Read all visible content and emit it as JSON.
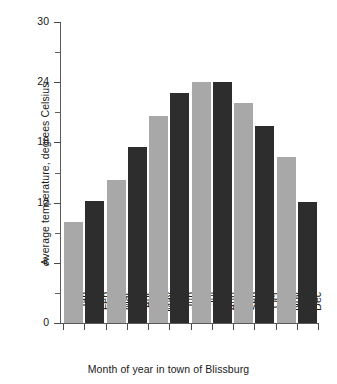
{
  "chart_data": {
    "type": "bar",
    "title": "",
    "xlabel": "Month of year in town of Blissburg",
    "ylabel": "Average temperature, degrees Celsius",
    "categories": [
      "Jan",
      "Feb",
      "Mar",
      "Apr",
      "May",
      "Jun",
      "Jul",
      "Aug",
      "Sep",
      "Oct",
      "Nov",
      "Dec"
    ],
    "values": [
      10.1,
      12.2,
      14.3,
      17.5,
      20.6,
      22.9,
      24.0,
      24.0,
      21.9,
      19.6,
      16.5,
      12.1
    ],
    "ylim": [
      0,
      30
    ],
    "xlim_note": "categorical, 12 adjacent bars",
    "ytick_labels": [
      "0",
      "6",
      "12",
      "18",
      "24",
      "30"
    ],
    "ytick_values": [
      0,
      6,
      12,
      18,
      24,
      30
    ],
    "yminor_tick_values": [
      3,
      9,
      15,
      21,
      27
    ],
    "grid": false,
    "legend": null,
    "bar_colors": [
      "#a8a8a8",
      "#2d2d2d",
      "#a8a8a8",
      "#2d2d2d",
      "#a8a8a8",
      "#2d2d2d",
      "#a8a8a8",
      "#2d2d2d",
      "#a8a8a8",
      "#2d2d2d",
      "#a8a8a8",
      "#2d2d2d"
    ],
    "colors": {
      "light_bar": "#a8a8a8",
      "dark_bar": "#2d2d2d",
      "axis": "#5a5a5a",
      "text": "#1a1a1a",
      "background": "#ffffff"
    }
  },
  "axis": {
    "y_title": "Average temperature, degrees Celsius",
    "x_title": "Month of year in town of Blissburg"
  }
}
